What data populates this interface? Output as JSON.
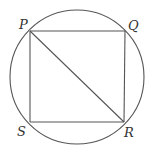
{
  "diagram": {
    "colors": {
      "stroke": "#555555",
      "label": "#333333",
      "background": "#ffffff"
    },
    "circle": {
      "cx": 77,
      "cy": 77,
      "r": 67
    },
    "vertices": {
      "P": {
        "label": "P",
        "x": 30,
        "y": 31
      },
      "Q": {
        "label": "Q",
        "x": 125,
        "y": 31
      },
      "R": {
        "label": "R",
        "x": 124,
        "y": 122
      },
      "S": {
        "label": "S",
        "x": 30,
        "y": 122
      }
    },
    "segments": [
      {
        "from": "P",
        "to": "Q"
      },
      {
        "from": "Q",
        "to": "R"
      },
      {
        "from": "R",
        "to": "S"
      },
      {
        "from": "S",
        "to": "P"
      },
      {
        "from": "P",
        "to": "R"
      }
    ]
  }
}
